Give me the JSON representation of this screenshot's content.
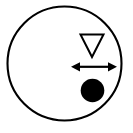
{
  "figure": {
    "background_color": "#ffffff",
    "stroke_color": "#000000",
    "fill_color": "#000000",
    "canvas": {
      "width": 133,
      "height": 133
    }
  },
  "shapes": {
    "outer_circle": {
      "name": "outer-circle",
      "kind": "circle-outline",
      "cx": 64.5,
      "cy": 63.5,
      "r": 57,
      "stroke_width": 2.1,
      "fill": "none",
      "stroke": "#000000"
    },
    "triangle": {
      "name": "down-triangle",
      "kind": "triangle-outline",
      "orientation": "down",
      "points": "80.5,34.5 103.5,34.5 92,57",
      "left_x": 80.5,
      "right_x": 103.5,
      "top_y": 34.5,
      "apex_x": 92,
      "apex_y": 57,
      "stroke_width": 2.0,
      "fill": "none",
      "stroke": "#000000"
    },
    "arrow": {
      "name": "double-headed-arrow",
      "kind": "arrow-double",
      "direction": "horizontal",
      "y": 66.8,
      "left_tip_x": 71,
      "right_tip_x": 117,
      "shaft_left_x": 80,
      "shaft_right_x": 108,
      "shaft_width": 2.2,
      "head_length": 9,
      "head_half_height": 4.6,
      "fill": "#000000",
      "stroke": "#000000"
    },
    "dot": {
      "name": "filled-dot",
      "kind": "circle-filled",
      "cx": 92.5,
      "cy": 90.5,
      "r": 11.8,
      "fill": "#000000",
      "stroke": "none"
    }
  }
}
